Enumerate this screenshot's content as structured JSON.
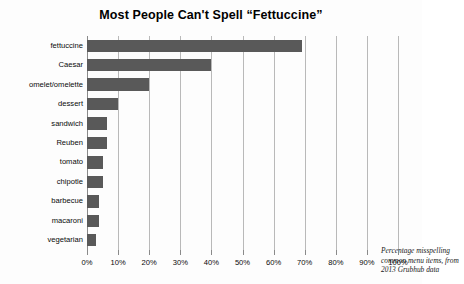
{
  "chart_data": {
    "type": "bar",
    "orientation": "horizontal",
    "title": "Most People Can't Spell “Fettuccine”",
    "xlabel": "",
    "ylabel": "",
    "xlim": [
      0,
      100
    ],
    "grid": "vertical",
    "legend": "none",
    "bar_color": "#595959",
    "categories": [
      "fettuccine",
      "Caesar",
      "omelet/omelette",
      "dessert",
      "sandwich",
      "Reuben",
      "tomato",
      "chipotle",
      "barbecue",
      "macaroni",
      "vegetarian"
    ],
    "values": [
      69,
      40,
      20,
      10,
      6.5,
      6.5,
      5,
      5,
      4,
      4,
      3
    ],
    "xticks": [
      0,
      10,
      20,
      30,
      40,
      50,
      60,
      70,
      80,
      90,
      100
    ],
    "xticklabels": [
      "0%",
      "10%",
      "20%",
      "30%",
      "40%",
      "50%",
      "60%",
      "70%",
      "80%",
      "90%",
      "100%"
    ],
    "annotation": {
      "lines": [
        "Percentage misspelling",
        "common menu items, from",
        "2013 Grubhub data"
      ]
    }
  }
}
